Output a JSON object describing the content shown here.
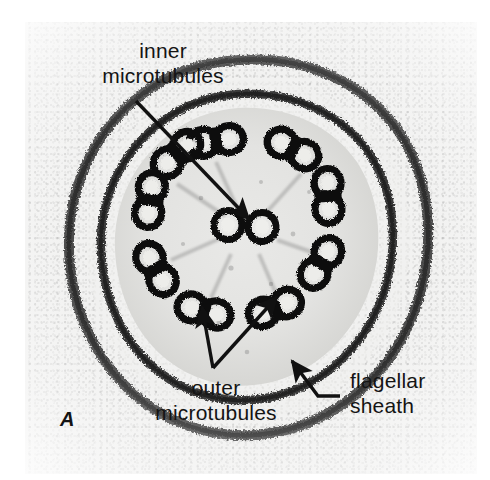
{
  "figure": {
    "panel_letter": "A",
    "background_color": "#ffffff",
    "plate_color": "#f2f2f1",
    "ink_color": "#141414"
  },
  "labels": [
    {
      "name": "inner-microtubules",
      "line1": "inner",
      "line2": "microtubules",
      "x": 78,
      "y": 38,
      "align": "center",
      "leader": "straight-arrow",
      "arrow_from": [
        136,
        101
      ],
      "arrow_to": [
        249,
        219
      ]
    },
    {
      "name": "outer-microtubules",
      "line1": "outer",
      "line2": "microtubules",
      "x": 141,
      "y": 375,
      "align": "center",
      "leader": "double-arrow",
      "arrow_from": [
        213,
        368
      ],
      "arrow_to_1": [
        202,
        307
      ],
      "arrow_to_2": [
        277,
        297
      ]
    },
    {
      "name": "flagellar-sheath",
      "line1": "flagellar",
      "line2": "sheath",
      "x": 350,
      "y": 368,
      "align": "left",
      "leader": "elbow-arrow",
      "elbow_start": [
        340,
        396
      ],
      "elbow_corner": [
        318,
        396
      ],
      "arrow_to": [
        292,
        361
      ]
    }
  ],
  "structure": {
    "description": "9+2 axoneme in cross-section",
    "outer_doublet_count": 9,
    "central_singlet_count": 2,
    "membrane_layers": [
      "axonemal-membrane",
      "flagellar-sheath"
    ],
    "outer_doublets": [
      {
        "id": 1,
        "cx": 191,
        "cy": 119,
        "rot": -8
      },
      {
        "id": 2,
        "cx": 268,
        "cy": 127,
        "rot": 28
      },
      {
        "id": 3,
        "cx": 303,
        "cy": 174,
        "rot": 88
      },
      {
        "id": 4,
        "cx": 296,
        "cy": 241,
        "rot": 122
      },
      {
        "id": 5,
        "cx": 250,
        "cy": 286,
        "rot": 158
      },
      {
        "id": 6,
        "cx": 179,
        "cy": 289,
        "rot": 196
      },
      {
        "id": 7,
        "cx": 131,
        "cy": 247,
        "rot": 240
      },
      {
        "id": 8,
        "cx": 125,
        "cy": 178,
        "rot": 278
      },
      {
        "id": 9,
        "cx": 152,
        "cy": 132,
        "rot": 318
      }
    ],
    "central_singlets": [
      {
        "id": "c1",
        "cx": 203,
        "cy": 203
      },
      {
        "id": "c2",
        "cx": 237,
        "cy": 205
      }
    ]
  }
}
